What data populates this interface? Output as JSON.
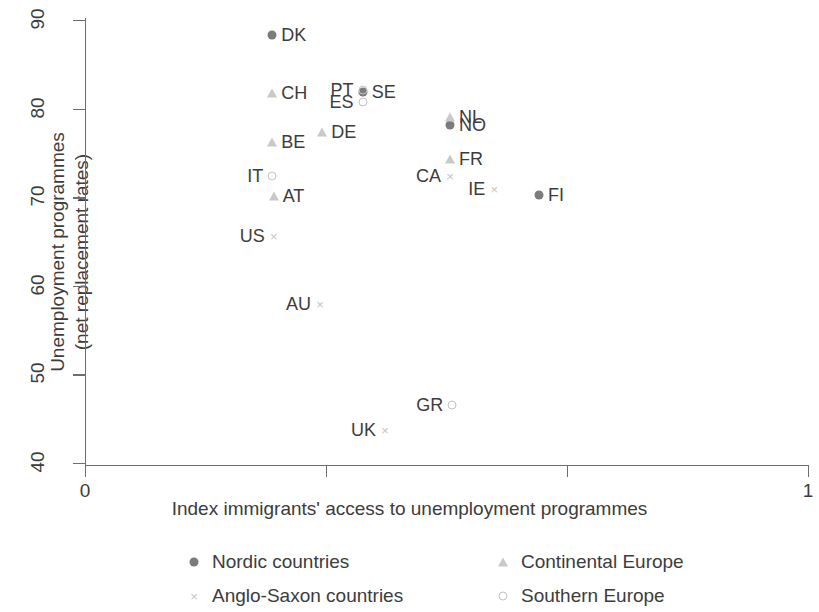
{
  "chart_data": {
    "type": "scatter",
    "title": "",
    "xlabel": "Index immigrants' access to unemployment programmes",
    "ylabel": "Unemployment programmes\n(net replacement rates)",
    "xlim": [
      0,
      1
    ],
    "ylim": [
      40,
      90
    ],
    "grid": false,
    "xticks": [
      {
        "value": 0,
        "label": "0"
      },
      {
        "value": 0.3333,
        "label": ""
      },
      {
        "value": 0.6667,
        "label": ""
      },
      {
        "value": 1,
        "label": "1"
      }
    ],
    "yticks": [
      {
        "value": 90,
        "label": "90"
      },
      {
        "value": 80,
        "label": "80"
      },
      {
        "value": 70,
        "label": "70"
      },
      {
        "value": 60,
        "label": "60"
      },
      {
        "value": 50,
        "label": "50"
      },
      {
        "value": 40,
        "label": "40"
      }
    ],
    "legend_position": "below-axis",
    "series": [
      {
        "name": "Nordic countries",
        "marker": "filled-circle",
        "color": "#7b7b7b",
        "points": [
          {
            "label": "DK",
            "x": 0.259,
            "y": 88.3,
            "label_side": "right"
          },
          {
            "label": "SE",
            "x": 0.384,
            "y": 81.9,
            "label_side": "right"
          },
          {
            "label": "NO",
            "x": 0.505,
            "y": 78.1,
            "label_side": "right"
          },
          {
            "label": "FI",
            "x": 0.628,
            "y": 70.2,
            "label_side": "right"
          }
        ]
      },
      {
        "name": "Continental Europe",
        "marker": "triangle",
        "color": "#c9c9c9",
        "points": [
          {
            "label": "CH",
            "x": 0.259,
            "y": 81.8,
            "label_side": "right"
          },
          {
            "label": "BE",
            "x": 0.259,
            "y": 76.2,
            "label_side": "right"
          },
          {
            "label": "AT",
            "x": 0.261,
            "y": 70.1,
            "label_side": "right"
          },
          {
            "label": "DE",
            "x": 0.328,
            "y": 77.4,
            "label_side": "right"
          },
          {
            "label": "NL",
            "x": 0.505,
            "y": 79.1,
            "label_side": "right"
          },
          {
            "label": "FR",
            "x": 0.505,
            "y": 74.3,
            "label_side": "right"
          }
        ]
      },
      {
        "name": "Anglo-Saxon countries",
        "marker": "cross",
        "color": "#c4c4c4",
        "points": [
          {
            "label": "US",
            "x": 0.261,
            "y": 65.6,
            "label_side": "left"
          },
          {
            "label": "AU",
            "x": 0.325,
            "y": 58.0,
            "label_side": "left"
          },
          {
            "label": "UK",
            "x": 0.415,
            "y": 43.7,
            "label_side": "left"
          },
          {
            "label": "CA",
            "x": 0.505,
            "y": 72.4,
            "label_side": "left"
          },
          {
            "label": "IE",
            "x": 0.566,
            "y": 70.9,
            "label_side": "left"
          }
        ]
      },
      {
        "name": "Southern Europe",
        "marker": "open-circle",
        "color": "#c2c2c2",
        "points": [
          {
            "label": "IT",
            "x": 0.259,
            "y": 72.4,
            "label_side": "left"
          },
          {
            "label": "PT",
            "x": 0.384,
            "y": 82.1,
            "label_side": "left"
          },
          {
            "label": "ES",
            "x": 0.384,
            "y": 80.8,
            "label_side": "left"
          },
          {
            "label": "GR",
            "x": 0.508,
            "y": 46.5,
            "label_side": "left"
          }
        ]
      }
    ]
  },
  "legend": {
    "items": [
      {
        "label": "Nordic countries",
        "marker": "filled-circle"
      },
      {
        "label": "Continental Europe",
        "marker": "triangle"
      },
      {
        "label": "Anglo-Saxon countries",
        "marker": "cross"
      },
      {
        "label": "Southern Europe",
        "marker": "open-circle"
      }
    ]
  }
}
